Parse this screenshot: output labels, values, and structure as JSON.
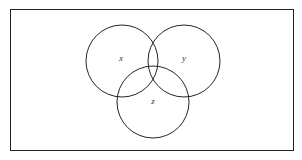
{
  "figure": {
    "kind": "venn-diagram",
    "background_color": "#ffffff",
    "stroke_color": "#262626",
    "label_color": "#3a3a3a",
    "frame": {
      "x": 10,
      "y": 9,
      "width": 284,
      "height": 142,
      "border_width": 1,
      "border_color": "#222222"
    },
    "circles": [
      {
        "id": "circle-x",
        "cx": 122,
        "cy": 61,
        "r": 36,
        "stroke_width": 1
      },
      {
        "id": "circle-y",
        "cx": 184,
        "cy": 61,
        "r": 36,
        "stroke_width": 1
      },
      {
        "id": "circle-z",
        "cx": 153,
        "cy": 102,
        "r": 36,
        "stroke_width": 1
      }
    ],
    "labels": [
      {
        "id": "label-x",
        "text": "x",
        "x": 121,
        "y": 58,
        "font_size": 9
      },
      {
        "id": "label-y",
        "text": "y",
        "x": 184,
        "y": 58,
        "font_size": 9
      },
      {
        "id": "label-z",
        "text": "z",
        "x": 153,
        "y": 101,
        "font_size": 9
      }
    ]
  }
}
